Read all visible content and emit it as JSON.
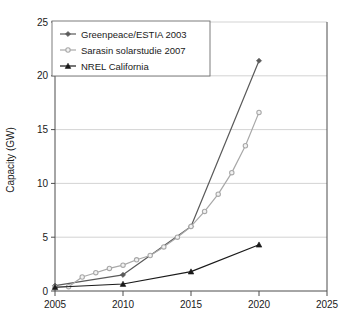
{
  "chart_data": {
    "type": "line",
    "title": "",
    "xlabel": "",
    "ylabel": "Capacity (GW)",
    "xlim": [
      2005,
      2025
    ],
    "ylim": [
      0,
      25
    ],
    "xticks": [
      2005,
      2010,
      2015,
      2020,
      2025
    ],
    "yticks": [
      0,
      5,
      10,
      15,
      20,
      25
    ],
    "grid": true,
    "legend_position": "top-left",
    "series": [
      {
        "name": "Greenpeace/ESTIA 2003",
        "color": "#5a5a5a",
        "marker": "diamond",
        "x": [
          2005,
          2010,
          2015,
          2020
        ],
        "values": [
          0.5,
          1.5,
          6.0,
          21.4
        ]
      },
      {
        "name": "Sarasin solarstudie 2007",
        "color": "#a8a8a8",
        "marker": "circle",
        "x": [
          2005,
          2006,
          2007,
          2008,
          2009,
          2010,
          2011,
          2012,
          2013,
          2014,
          2015,
          2016,
          2017,
          2018,
          2019,
          2020
        ],
        "values": [
          0.35,
          0.4,
          1.3,
          1.7,
          2.1,
          2.4,
          2.9,
          3.3,
          4.1,
          5.0,
          6.0,
          7.4,
          9.0,
          11.0,
          13.5,
          16.6
        ]
      },
      {
        "name": "NREL California",
        "color": "#1a1a1a",
        "marker": "triangle",
        "x": [
          2005,
          2010,
          2015,
          2020
        ],
        "values": [
          0.35,
          0.65,
          1.8,
          4.3
        ]
      }
    ]
  },
  "axis": {
    "y_title": "Capacity (GW)",
    "y_tick_labels": [
      "0",
      "5",
      "10",
      "15",
      "20",
      "25"
    ],
    "x_tick_labels": [
      "2005",
      "2010",
      "2015",
      "2020",
      "2025"
    ]
  },
  "legend": {
    "entries": [
      {
        "label": "Greenpeace/ESTIA 2003"
      },
      {
        "label": "Sarasin solarstudie 2007"
      },
      {
        "label": "NREL California"
      }
    ]
  },
  "colors": {
    "greenpeace": "#5a5a5a",
    "sarasin": "#a8a8a8",
    "nrel": "#1a1a1a",
    "grid": "#c8c8c8",
    "axis": "#4d4d4d",
    "background": "#ffffff"
  }
}
